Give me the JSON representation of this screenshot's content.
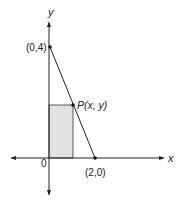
{
  "diagram": {
    "axes": {
      "x_label": "x",
      "y_label": "y",
      "origin_label": "0"
    },
    "points": {
      "y_intercept": {
        "label": "(0,4)"
      },
      "x_intercept": {
        "label": "(2,0)"
      },
      "p": {
        "label": "P(x, y)"
      }
    },
    "colors": {
      "line": "#222222",
      "rect_fill": "#e2e2e2",
      "background": "#ffffff"
    }
  }
}
